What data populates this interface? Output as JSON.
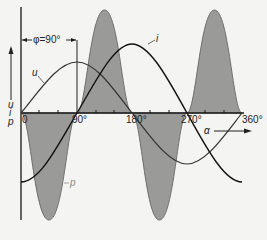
{
  "diagram": {
    "phase_label": "φ=90°",
    "y_axis_label_u": "u",
    "y_axis_label_i": "i",
    "y_axis_label_p": "p",
    "x_axis_label": "α",
    "ticks": [
      "0",
      "90°",
      "180°",
      "270°",
      "360°"
    ],
    "curve_labels": {
      "u": "u",
      "i": "i",
      "p": "p"
    },
    "colors": {
      "background": "#f4f4f2",
      "power_fill": "#9a9a98",
      "power_edge": "#6f6f6d",
      "curve_stroke": "#222222",
      "axis": "#1a1a1a"
    }
  }
}
